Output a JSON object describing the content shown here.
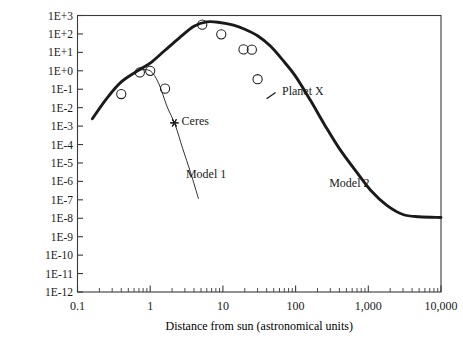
{
  "chart_data": {
    "type": "line",
    "title": "",
    "xlabel": "Distance from sun (astronomical units)",
    "ylabel": "Mass (units of earth's mass)",
    "xscale": "log",
    "yscale": "log",
    "xlim": [
      0.1,
      10000
    ],
    "ylim": [
      1e-12,
      1000
    ],
    "grid": false,
    "legend": "none",
    "xticks": [
      "0.1",
      "1",
      "10",
      "100",
      "1,000",
      "10,000"
    ],
    "xtick_values": [
      0.1,
      1,
      10,
      100,
      1000,
      10000
    ],
    "yticks": [
      "1E+3",
      "1E+2",
      "1E+1",
      "1E+0",
      "1E-1",
      "1E-2",
      "1E-3",
      "1E-4",
      "1E-5",
      "1E-6",
      "1E-7",
      "1E-8",
      "1E-9",
      "1E-10",
      "1E-11",
      "1E-12"
    ],
    "ytick_values": [
      1000,
      100,
      10,
      1,
      0.1,
      0.01,
      0.001,
      0.0001,
      1e-05,
      1e-06,
      1e-07,
      1e-08,
      1e-09,
      1e-10,
      1e-11,
      1e-12
    ],
    "series": [
      {
        "name": "Model 2",
        "style": "thick-solid-curve",
        "color": "#1a1a1a",
        "x": [
          0.16,
          0.25,
          0.4,
          0.7,
          1.0,
          1.6,
          2.5,
          4.0,
          6.0,
          9.0,
          14,
          20,
          30,
          45,
          70,
          100,
          160,
          250,
          400,
          700,
          1100,
          1800,
          3000,
          5000,
          10000
        ],
        "y": [
          0.0025,
          0.03,
          0.25,
          1.1,
          2.6,
          13,
          60,
          260,
          450,
          420,
          300,
          180,
          80,
          22,
          3.0,
          0.5,
          0.025,
          0.0012,
          6e-05,
          3e-06,
          3e-07,
          5e-08,
          1.6e-08,
          1.2e-08,
          1.1e-08
        ]
      },
      {
        "name": "Model 1",
        "style": "thin-solid-line",
        "color": "#1a1a1a",
        "x": [
          0.7,
          1.0,
          1.3,
          1.7,
          2.2,
          2.8,
          3.6,
          4.6
        ],
        "y": [
          1.1,
          1.0,
          0.22,
          0.012,
          0.0012,
          6e-05,
          3e-06,
          1.2e-07
        ]
      }
    ],
    "points": {
      "name": "observed-planets",
      "marker": "open-circle",
      "x": [
        0.4,
        0.72,
        1.0,
        1.6,
        5.2,
        9.5,
        19.2,
        25,
        30
      ],
      "y": [
        0.055,
        0.82,
        1.0,
        0.107,
        318,
        95,
        14.5,
        14.0,
        0.35
      ]
    },
    "markers": [
      {
        "label": "Ceres",
        "marker": "asterisk",
        "x": 2.15,
        "y": 0.0015
      },
      {
        "label": "Planet X",
        "marker": "cross-tick",
        "x": 46,
        "y": 0.045
      }
    ],
    "annotations": [
      {
        "text": "Ceres",
        "x": 2.7,
        "y": 0.0016
      },
      {
        "text": "Planet X",
        "x": 65,
        "y": 0.07
      },
      {
        "text": "Model 1",
        "x": 3.1,
        "y": 2.2e-06
      },
      {
        "text": "Model 2",
        "x": 290,
        "y": 7e-07
      }
    ]
  },
  "axes": {
    "ylabel": "Mass (units of earth's mass)",
    "xlabel": "Distance from sun (astronomical units)"
  }
}
